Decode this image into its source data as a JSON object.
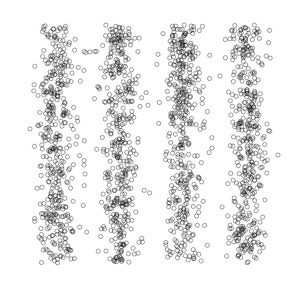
{
  "chart_data": {
    "type": "scatter",
    "title": "",
    "xlabel": "",
    "ylabel": "",
    "grid": false,
    "legend": null,
    "axes_visible": false,
    "marker": "open-circle",
    "marker_color": "#000000",
    "marker_alpha": 0.55,
    "plot_area_px": {
      "x0": 25,
      "y0": 25,
      "x1": 278,
      "y1": 263
    },
    "xlim": [
      0,
      4
    ],
    "ylim": [
      0,
      1
    ],
    "groups": [
      {
        "name": "group-1",
        "center_x": 0.5,
        "spread_x": 0.14,
        "n_points": 420
      },
      {
        "name": "group-2",
        "center_x": 1.5,
        "spread_x": 0.14,
        "n_points": 420
      },
      {
        "name": "group-3",
        "center_x": 2.5,
        "spread_x": 0.14,
        "n_points": 420
      },
      {
        "name": "group-4",
        "center_x": 3.5,
        "spread_x": 0.14,
        "n_points": 420
      }
    ],
    "y_distribution": "uniform over [0, 1] for every group",
    "x_distribution": "normal jitter around each group's center, clipped to plot area",
    "seed": 7
  }
}
